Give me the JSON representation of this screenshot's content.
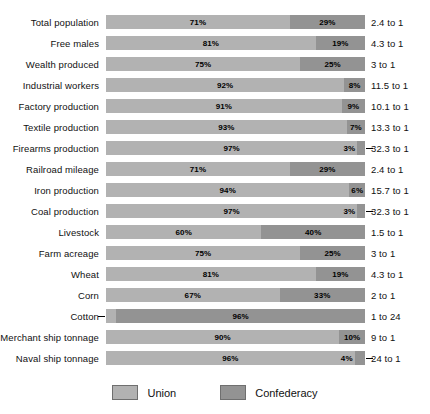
{
  "chart_data": {
    "type": "bar",
    "subtype": "stacked-horizontal-100-percent",
    "title": "",
    "xlabel": "",
    "ylabel": "",
    "xlim": [
      0,
      100
    ],
    "grid": false,
    "legend_position": "bottom-center",
    "categories": [
      "Total population",
      "Free males",
      "Wealth produced",
      "Industrial workers",
      "Factory production",
      "Textile production",
      "Firearms production",
      "Railroad mileage",
      "Iron production",
      "Coal production",
      "Livestock",
      "Farm acreage",
      "Wheat",
      "Corn",
      "Cotton",
      "Merchant ship tonnage",
      "Naval ship tonnage"
    ],
    "series": [
      {
        "name": "Union",
        "color": "#b2b2b2",
        "values": [
          71,
          81,
          75,
          92,
          91,
          93,
          97,
          71,
          94,
          97,
          60,
          75,
          81,
          67,
          4,
          90,
          96
        ]
      },
      {
        "name": "Confederacy",
        "color": "#939393",
        "values": [
          29,
          19,
          25,
          8,
          9,
          7,
          3,
          29,
          6,
          3,
          40,
          25,
          19,
          33,
          96,
          10,
          4
        ]
      }
    ],
    "ratios": [
      "2.4 to 1",
      "4.3 to 1",
      "3 to 1",
      "11.5 to 1",
      "10.1 to 1",
      "13.3 to 1",
      "32.3 to 1",
      "2.4 to 1",
      "15.7 to 1",
      "32.3 to 1",
      "1.5 to 1",
      "3 to 1",
      "4.3 to 1",
      "2 to 1",
      "1 to 24",
      "9 to 1",
      "24 to 1"
    ],
    "rows": [
      {
        "label": "Total population",
        "union": 71,
        "confederacy": 29,
        "union_text": "71%",
        "confederacy_text": "29%",
        "ratio": "2.4 to 1",
        "union_tiny": false,
        "confederacy_tiny": false
      },
      {
        "label": "Free males",
        "union": 81,
        "confederacy": 19,
        "union_text": "81%",
        "confederacy_text": "19%",
        "ratio": "4.3 to 1",
        "union_tiny": false,
        "confederacy_tiny": false
      },
      {
        "label": "Wealth produced",
        "union": 75,
        "confederacy": 25,
        "union_text": "75%",
        "confederacy_text": "25%",
        "ratio": "3 to 1",
        "union_tiny": false,
        "confederacy_tiny": false
      },
      {
        "label": "Industrial workers",
        "union": 92,
        "confederacy": 8,
        "union_text": "92%",
        "confederacy_text": "8%",
        "ratio": "11.5 to 1",
        "union_tiny": false,
        "confederacy_tiny": false
      },
      {
        "label": "Factory production",
        "union": 91,
        "confederacy": 9,
        "union_text": "91%",
        "confederacy_text": "9%",
        "ratio": "10.1 to 1",
        "union_tiny": false,
        "confederacy_tiny": false
      },
      {
        "label": "Textile production",
        "union": 93,
        "confederacy": 7,
        "union_text": "93%",
        "confederacy_text": "7%",
        "ratio": "13.3 to 1",
        "union_tiny": false,
        "confederacy_tiny": false
      },
      {
        "label": "Firearms production",
        "union": 97,
        "confederacy": 3,
        "union_text": "97%",
        "confederacy_text": "3%",
        "ratio": "32.3 to 1",
        "union_tiny": false,
        "confederacy_tiny": true
      },
      {
        "label": "Railroad mileage",
        "union": 71,
        "confederacy": 29,
        "union_text": "71%",
        "confederacy_text": "29%",
        "ratio": "2.4 to 1",
        "union_tiny": false,
        "confederacy_tiny": false
      },
      {
        "label": "Iron production",
        "union": 94,
        "confederacy": 6,
        "union_text": "94%",
        "confederacy_text": "6%",
        "ratio": "15.7 to 1",
        "union_tiny": false,
        "confederacy_tiny": false
      },
      {
        "label": "Coal production",
        "union": 97,
        "confederacy": 3,
        "union_text": "97%",
        "confederacy_text": "3%",
        "ratio": "32.3 to 1",
        "union_tiny": false,
        "confederacy_tiny": true
      },
      {
        "label": "Livestock",
        "union": 60,
        "confederacy": 40,
        "union_text": "60%",
        "confederacy_text": "40%",
        "ratio": "1.5 to 1",
        "union_tiny": false,
        "confederacy_tiny": false
      },
      {
        "label": "Farm acreage",
        "union": 75,
        "confederacy": 25,
        "union_text": "75%",
        "confederacy_text": "25%",
        "ratio": "3 to 1",
        "union_tiny": false,
        "confederacy_tiny": false
      },
      {
        "label": "Wheat",
        "union": 81,
        "confederacy": 19,
        "union_text": "81%",
        "confederacy_text": "19%",
        "ratio": "4.3 to 1",
        "union_tiny": false,
        "confederacy_tiny": false
      },
      {
        "label": "Corn",
        "union": 67,
        "confederacy": 33,
        "union_text": "67%",
        "confederacy_text": "33%",
        "ratio": "2 to 1",
        "union_tiny": false,
        "confederacy_tiny": false
      },
      {
        "label": "Cotton",
        "union": 4,
        "confederacy": 96,
        "union_text": "4%",
        "confederacy_text": "96%",
        "ratio": "1 to 24",
        "union_tiny": true,
        "confederacy_tiny": false
      },
      {
        "label": "Merchant ship tonnage",
        "union": 90,
        "confederacy": 10,
        "union_text": "90%",
        "confederacy_text": "10%",
        "ratio": "9 to 1",
        "union_tiny": false,
        "confederacy_tiny": false
      },
      {
        "label": "Naval ship tonnage",
        "union": 96,
        "confederacy": 4,
        "union_text": "96%",
        "confederacy_text": "4%",
        "ratio": "24 to 1",
        "union_tiny": false,
        "confederacy_tiny": true
      }
    ],
    "legend": [
      {
        "label": "Union",
        "color": "#b2b2b2"
      },
      {
        "label": "Confederacy",
        "color": "#939393"
      }
    ]
  }
}
